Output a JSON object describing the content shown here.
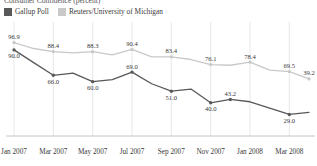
{
  "title": "Consumer Confidence (percent)",
  "legend": {
    "items": [
      {
        "label": "Gallup Poll",
        "color": "#595959",
        "key": "gallup"
      },
      {
        "label": "Reuters/University of Michigan",
        "color": "#c9c9c9",
        "key": "reuters"
      }
    ]
  },
  "chart_data": {
    "type": "line",
    "title": "Consumer Confidence (percent)",
    "xlabel": "",
    "ylabel": "",
    "grid": true,
    "legend_position": "top-left",
    "ylim": [
      20,
      105
    ],
    "x": [
      "Jan 2007",
      "Feb 2007",
      "Mar 2007",
      "Apr 2007",
      "May 2007",
      "Jun 2007",
      "Jul 2007",
      "Aug 2007",
      "Sep 2007",
      "Oct 2007",
      "Nov 2007",
      "Dec 2007",
      "Jan 2008",
      "Feb 2008",
      "Mar 2008",
      "Apr 2008"
    ],
    "tick_labels": [
      "Jan 2007",
      "Mar 2007",
      "May 2007",
      "Jul 2007",
      "Sep 2007",
      "Nov 2007",
      "Jan 2008",
      "Mar 2008"
    ],
    "series": [
      {
        "name": "Gallup Poll",
        "color": "#595959",
        "values": [
          90.0,
          78.0,
          66.0,
          68.0,
          60.0,
          62.0,
          69.0,
          58.0,
          51.0,
          53.0,
          40.0,
          43.2,
          41.0,
          35.0,
          29.0,
          31.0
        ],
        "labels": [
          {
            "i": 0,
            "text": "90.0",
            "pos": "below"
          },
          {
            "i": 2,
            "text": "66.0",
            "pos": "below"
          },
          {
            "i": 4,
            "text": "60.0",
            "pos": "below"
          },
          {
            "i": 6,
            "text": "69.0",
            "pos": "above"
          },
          {
            "i": 8,
            "text": "51.0",
            "pos": "below"
          },
          {
            "i": 10,
            "text": "40.0",
            "pos": "below"
          },
          {
            "i": 11,
            "text": "43.2",
            "pos": "above"
          },
          {
            "i": 14,
            "text": "29.0",
            "pos": "below"
          }
        ]
      },
      {
        "name": "Reuters/University of Michigan",
        "color": "#c9c9c9",
        "values": [
          96.9,
          91.3,
          88.4,
          87.1,
          88.3,
          85.3,
          90.4,
          83.4,
          83.4,
          80.9,
          76.1,
          75.5,
          78.4,
          70.8,
          69.5,
          62.6
        ],
        "labels": [
          {
            "i": 0,
            "text": "96.9",
            "pos": "above"
          },
          {
            "i": 2,
            "text": "88.4",
            "pos": "above"
          },
          {
            "i": 4,
            "text": "88.3",
            "pos": "above"
          },
          {
            "i": 6,
            "text": "90.4",
            "pos": "above"
          },
          {
            "i": 8,
            "text": "83.4",
            "pos": "above"
          },
          {
            "i": 10,
            "text": "76.1",
            "pos": "above"
          },
          {
            "i": 12,
            "text": "78.4",
            "pos": "above"
          },
          {
            "i": 14,
            "text": "69.5",
            "pos": "above"
          },
          {
            "i": 15,
            "text": "39.2",
            "pos": "above"
          }
        ]
      }
    ]
  }
}
